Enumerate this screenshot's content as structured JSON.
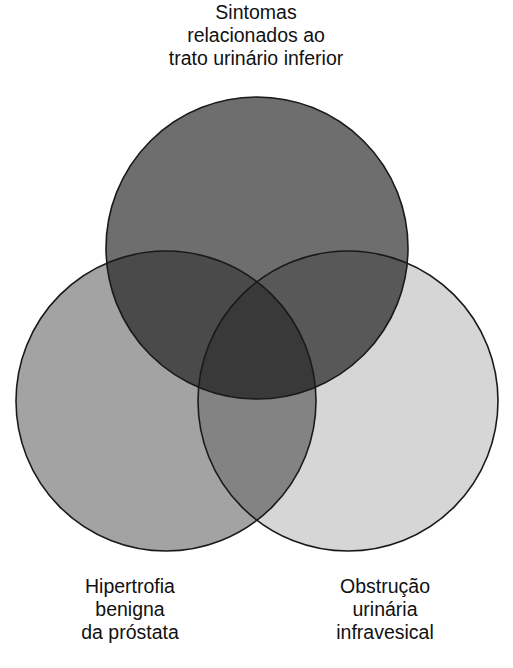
{
  "diagram": {
    "type": "venn",
    "sets": [
      {
        "id": "luts",
        "label_lines": [
          "Sintomas",
          "relacionados ao",
          "trato urinário inferior"
        ],
        "fill": "#6e6e6e",
        "position": "top"
      },
      {
        "id": "hpb",
        "label_lines": [
          "Hipertrofia",
          "benigna",
          "da próstata"
        ],
        "fill": "#a3a3a3",
        "position": "bottom-left"
      },
      {
        "id": "obstruction",
        "label_lines": [
          "Obstrução",
          "urinária",
          "infravesical"
        ],
        "fill": "#d6d6d6",
        "position": "bottom-right"
      }
    ],
    "overlaps": {
      "top_left": "#4a4a4a",
      "top_right": "#585858",
      "left_right": "#838383",
      "center": "#393939"
    },
    "stroke": "#1a1a1a"
  }
}
